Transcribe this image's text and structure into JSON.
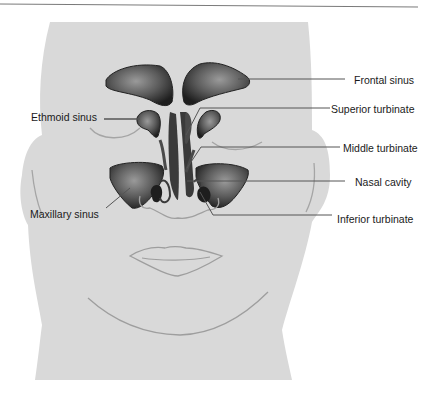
{
  "figure": {
    "labels": {
      "frontal_sinus": "Frontal sinus",
      "ethmoid_sinus": "Ethmoid sinus",
      "superior_turbinate": "Superior turbinate",
      "middle_turbinate": "Middle turbinate",
      "nasal_cavity": "Nasal cavity",
      "maxillary_sinus": "Maxillary sinus",
      "inferior_turbinate": "Inferior turbinate"
    },
    "colors": {
      "face_fill": "#d9d9d9",
      "outline": "#9a9a9a",
      "sinus_dark": "#2a2a2a",
      "sinus_light": "#8c8c8c",
      "leader_line": "#5a5a5a",
      "header_rule": "#7a7a7a"
    }
  }
}
